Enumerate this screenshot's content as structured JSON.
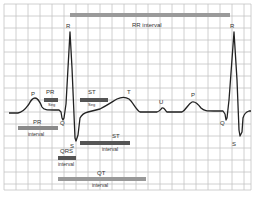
{
  "diagram": {
    "colors": {
      "grid": "#bdbdbd",
      "trace": "#222222",
      "segment_bar": "#555555",
      "interval_bar": "#9a9a9a",
      "label": "#333333"
    },
    "waves": {
      "P1": "P",
      "Q1": "Q",
      "R1": "R",
      "S1": "S",
      "T": "T",
      "U": "U",
      "P2": "P",
      "Q2": "Q",
      "R2": "R",
      "S2": "S"
    },
    "bars": {
      "rr_interval": "RR interval",
      "pr_seg_top": "PR",
      "pr_seg_bottom": "Seg",
      "st_seg_top": "ST",
      "st_seg_bottom": "Seg",
      "pr_int_top": "PR",
      "pr_int_bottom": "interval",
      "st_int_top": "ST",
      "st_int_bottom": "interval",
      "qrs_int_top": "QRS",
      "qrs_int_bottom": "interval",
      "qt_int_top": "QT",
      "qt_int_bottom": "interval"
    }
  }
}
